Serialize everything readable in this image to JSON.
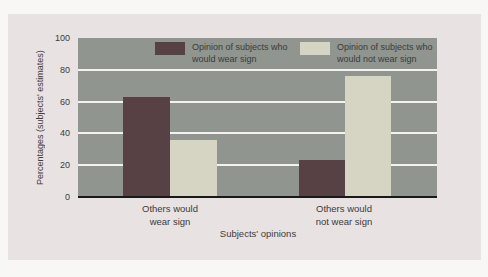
{
  "colors": {
    "page_background": "#f8f7f5",
    "card_background": "#e9e2e2",
    "plot_background": "#90958f",
    "gridline": "#f3f2ed",
    "axis_line": "#181818",
    "text": "#3b3b3b",
    "bar_wear": "#584144",
    "bar_not_wear": "#d6d4c2"
  },
  "chart_data": {
    "type": "bar",
    "title": "",
    "xlabel": "Subjects' opinions",
    "ylabel": "Percentages (subjects' estimates)",
    "ylim": [
      0,
      100
    ],
    "yticks": [
      0,
      20,
      40,
      60,
      80,
      100
    ],
    "grid": "horizontal white gridlines at 20, 40, 60, 80",
    "legend_position": "top inside plot area",
    "categories": [
      "Others would wear sign",
      "Others would not wear sign"
    ],
    "series": [
      {
        "name": "Opinion of subjects who would wear sign",
        "color": "#584144",
        "values": [
          63,
          23
        ]
      },
      {
        "name": "Opinion of subjects who would not wear sign",
        "color": "#d6d4c2",
        "values": [
          36,
          76
        ]
      }
    ]
  }
}
